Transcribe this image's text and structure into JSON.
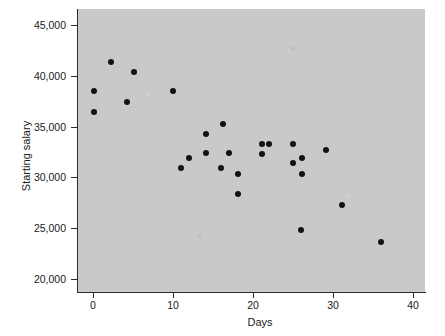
{
  "chart_data": {
    "type": "scatter",
    "title": "",
    "xlabel": "Days",
    "ylabel": "Starting salary",
    "xlim": [
      -3,
      43
    ],
    "ylim": [
      18500,
      46500
    ],
    "xticks": [
      0,
      10,
      20,
      30,
      40
    ],
    "xticklabels": [
      "0",
      "10",
      "20",
      "30",
      "40"
    ],
    "yticks": [
      20000,
      25000,
      30000,
      35000,
      40000,
      45000
    ],
    "yticklabels": [
      "20,000",
      "25,000",
      "30,000",
      "35,000",
      "40,000",
      "45,000"
    ],
    "grid": false,
    "legend": null,
    "marker_color": "#121212",
    "plot_background": "#c9c9c9",
    "points": [
      {
        "x": 0.1,
        "y": 38500
      },
      {
        "x": 0.1,
        "y": 36400
      },
      {
        "x": 2.3,
        "y": 41400
      },
      {
        "x": 4.3,
        "y": 37400
      },
      {
        "x": 5.1,
        "y": 40400
      },
      {
        "x": 10.0,
        "y": 38500
      },
      {
        "x": 11.0,
        "y": 30900
      },
      {
        "x": 12.0,
        "y": 31900
      },
      {
        "x": 14.1,
        "y": 34300
      },
      {
        "x": 14.1,
        "y": 32400
      },
      {
        "x": 16.3,
        "y": 35300
      },
      {
        "x": 16.0,
        "y": 30900
      },
      {
        "x": 17.0,
        "y": 32400
      },
      {
        "x": 18.1,
        "y": 30300
      },
      {
        "x": 18.1,
        "y": 28400
      },
      {
        "x": 21.1,
        "y": 33300
      },
      {
        "x": 22.0,
        "y": 33300
      },
      {
        "x": 21.1,
        "y": 32300
      },
      {
        "x": 25.0,
        "y": 33300
      },
      {
        "x": 26.1,
        "y": 31900
      },
      {
        "x": 25.0,
        "y": 31400
      },
      {
        "x": 26.1,
        "y": 30300
      },
      {
        "x": 29.1,
        "y": 32700
      },
      {
        "x": 26.0,
        "y": 24800
      },
      {
        "x": 31.1,
        "y": 27300
      },
      {
        "x": 36.0,
        "y": 23600
      }
    ]
  },
  "watermarks": {
    "fragment_1": "",
    "fragment_2": "",
    "fragment_3": ""
  }
}
